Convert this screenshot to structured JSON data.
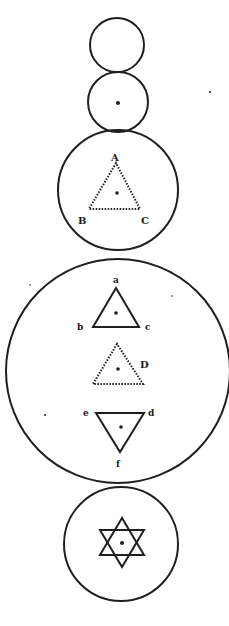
{
  "diagram": {
    "ink_color": "#1f1f1f",
    "background": "#ffffff",
    "circles": [
      {
        "id": "circle-1",
        "content": "empty"
      },
      {
        "id": "circle-2",
        "content": "center point"
      },
      {
        "id": "circle-3",
        "content": "dotted triangle ABC with center point"
      },
      {
        "id": "circle-4",
        "content": "triangles abc (upright), D (dotted upright), edf (inverted)"
      },
      {
        "id": "circle-5",
        "content": "hexagram with center point"
      }
    ],
    "labels": {
      "A": "A",
      "B": "B",
      "C": "C",
      "a": "a",
      "b": "b",
      "c": "c",
      "D": "D",
      "e": "e",
      "d": "d",
      "f": "f"
    }
  }
}
